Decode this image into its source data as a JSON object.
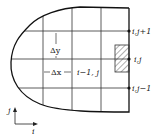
{
  "diagram": {
    "labels": {
      "node_top": "i,j+1",
      "node_mid": "i,j",
      "node_bottom": "i,j−1",
      "delta_y": "Δy",
      "delta_x": "Δx",
      "neighbor": "i−1, j",
      "axis_j": "j",
      "axis_i": "i"
    },
    "colors": {
      "line": "#222222",
      "background": "#ffffff"
    }
  }
}
